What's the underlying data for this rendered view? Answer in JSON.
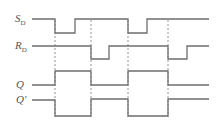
{
  "diagram": {
    "colors": {
      "waveform": "#6e6e6e",
      "dashed": "#7a7a7a",
      "label": "#555555"
    },
    "signals": [
      {
        "id": "SD",
        "label": "S",
        "subscript": "D",
        "label_y": 13,
        "high_y": 19,
        "low_y": 33,
        "points": [
          [
            32,
            19
          ],
          [
            55,
            19
          ],
          [
            55,
            33
          ],
          [
            75,
            33
          ],
          [
            75,
            19
          ],
          [
            128,
            19
          ],
          [
            128,
            33
          ],
          [
            147,
            33
          ],
          [
            147,
            19
          ],
          [
            209,
            19
          ]
        ]
      },
      {
        "id": "RD",
        "label": "R",
        "subscript": "D",
        "label_y": 40,
        "high_y": 46,
        "low_y": 59,
        "points": [
          [
            32,
            46
          ],
          [
            91,
            46
          ],
          [
            91,
            59
          ],
          [
            109,
            59
          ],
          [
            109,
            46
          ],
          [
            168,
            46
          ],
          [
            168,
            59
          ],
          [
            187,
            59
          ],
          [
            187,
            46
          ],
          [
            209,
            46
          ]
        ]
      },
      {
        "id": "Q",
        "label": "Q",
        "subscript": "",
        "label_y": 79,
        "points": [
          [
            32,
            85
          ],
          [
            55,
            85
          ],
          [
            55,
            71
          ],
          [
            91,
            71
          ],
          [
            91,
            85
          ],
          [
            128,
            85
          ],
          [
            128,
            71
          ],
          [
            168,
            71
          ],
          [
            168,
            85
          ],
          [
            209,
            85
          ]
        ]
      },
      {
        "id": "Qprime",
        "label": "Q'",
        "subscript": "",
        "label_y": 94,
        "points": [
          [
            32,
            100
          ],
          [
            55,
            100
          ],
          [
            55,
            116
          ],
          [
            91,
            116
          ],
          [
            91,
            99
          ],
          [
            128,
            99
          ],
          [
            128,
            116
          ],
          [
            168,
            116
          ],
          [
            168,
            99
          ],
          [
            209,
            99
          ]
        ]
      }
    ],
    "dashed_markers_x": [
      55,
      91,
      128,
      168
    ]
  }
}
